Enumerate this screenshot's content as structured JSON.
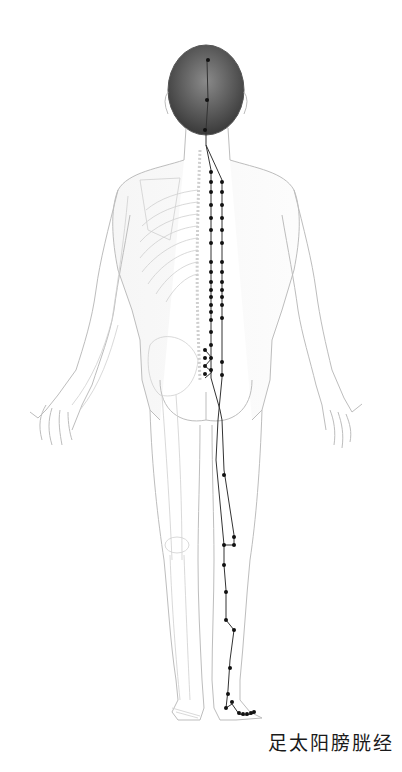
{
  "diagram": {
    "title": "足太阳膀胱经",
    "view": "posterior",
    "colors": {
      "background": "#ffffff",
      "outline": "#b8b8b8",
      "skeleton": "#c8c8c8",
      "hair": "#4a4a4a",
      "meridian_line": "#333333",
      "acupoint": "#111111",
      "caption": "#1a1a1a"
    },
    "meridian": {
      "head_neck_path": [
        [
          207,
          60
        ],
        [
          208,
          100
        ],
        [
          206,
          130
        ],
        [
          206,
          145
        ]
      ],
      "inner_line_path": [
        [
          206,
          145
        ],
        [
          211,
          170
        ],
        [
          211,
          180
        ],
        [
          211,
          200
        ],
        [
          211,
          215
        ],
        [
          211,
          230
        ],
        [
          211,
          245
        ],
        [
          211,
          260
        ],
        [
          211,
          275
        ],
        [
          211,
          290
        ],
        [
          211,
          305
        ],
        [
          211,
          320
        ],
        [
          211,
          335
        ],
        [
          211,
          350
        ],
        [
          211,
          365
        ],
        [
          211,
          378
        ],
        [
          220,
          410
        ],
        [
          222,
          420
        ],
        [
          224,
          470
        ],
        [
          234,
          535
        ],
        [
          234,
          545
        ],
        [
          228,
          545
        ]
      ],
      "outer_line_path": [
        [
          206,
          145
        ],
        [
          222,
          180
        ],
        [
          222,
          200
        ],
        [
          222,
          215
        ],
        [
          222,
          230
        ],
        [
          222,
          245
        ],
        [
          222,
          260
        ],
        [
          222,
          275
        ],
        [
          222,
          290
        ],
        [
          222,
          305
        ],
        [
          222,
          320
        ],
        [
          222,
          335
        ],
        [
          222,
          350
        ],
        [
          222,
          365
        ],
        [
          222,
          378
        ],
        [
          218,
          420
        ],
        [
          216,
          460
        ],
        [
          222,
          545
        ]
      ],
      "lower_leg_path": [
        [
          228,
          545
        ],
        [
          228,
          565
        ],
        [
          229,
          590
        ],
        [
          230,
          620
        ],
        [
          234,
          630
        ],
        [
          232,
          660
        ],
        [
          229,
          690
        ],
        [
          228,
          700
        ],
        [
          232,
          708
        ],
        [
          236,
          714
        ],
        [
          241,
          716
        ],
        [
          245,
          716
        ],
        [
          249,
          715
        ],
        [
          253,
          714
        ]
      ],
      "sacral_points": [
        [
          205,
          350
        ],
        [
          205,
          358
        ],
        [
          205,
          366
        ],
        [
          205,
          374
        ],
        [
          212,
          352
        ],
        [
          212,
          360
        ],
        [
          212,
          370
        ]
      ],
      "acupoints_head_neck": [
        [
          208,
          60
        ],
        [
          207,
          100
        ],
        [
          205,
          130
        ]
      ],
      "acupoints_inner": [
        [
          211,
          172
        ],
        [
          211,
          182
        ],
        [
          211,
          192
        ],
        [
          211,
          205
        ],
        [
          211,
          218
        ],
        [
          211,
          230
        ],
        [
          211,
          243
        ],
        [
          211,
          262
        ],
        [
          211,
          272
        ],
        [
          211,
          282
        ],
        [
          211,
          290
        ],
        [
          211,
          297
        ],
        [
          211,
          305
        ],
        [
          211,
          312
        ],
        [
          211,
          320
        ],
        [
          211,
          332
        ],
        [
          211,
          345
        ],
        [
          211,
          358
        ],
        [
          211,
          370
        ]
      ],
      "acupoints_outer": [
        [
          222,
          182
        ],
        [
          222,
          192
        ],
        [
          222,
          205
        ],
        [
          222,
          218
        ],
        [
          222,
          230
        ],
        [
          222,
          243
        ],
        [
          222,
          262
        ],
        [
          222,
          272
        ],
        [
          222,
          282
        ],
        [
          222,
          290
        ],
        [
          222,
          297
        ],
        [
          222,
          305
        ],
        [
          222,
          318
        ],
        [
          222,
          362
        ],
        [
          222,
          375
        ]
      ],
      "acupoints_leg": [
        [
          224,
          475
        ],
        [
          234,
          537
        ],
        [
          234,
          545
        ],
        [
          224,
          545
        ],
        [
          224,
          565
        ],
        [
          226,
          590
        ],
        [
          226,
          620
        ],
        [
          234,
          630
        ],
        [
          230,
          660
        ],
        [
          228,
          690
        ],
        [
          226,
          708
        ],
        [
          232,
          704
        ],
        [
          239,
          714
        ],
        [
          243,
          715
        ],
        [
          247,
          715
        ],
        [
          251,
          714
        ],
        [
          254,
          713
        ]
      ]
    }
  }
}
